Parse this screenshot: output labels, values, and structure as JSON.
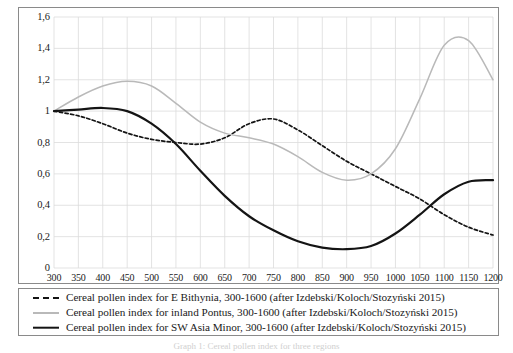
{
  "figure": {
    "caption": "Graph 1: Cereal pollen index for three regions"
  },
  "axes": {
    "y_ticks": [
      "0",
      "0,2",
      "0,4",
      "0,6",
      "0,8",
      "1",
      "1,2",
      "1,4",
      "1,6"
    ],
    "x_ticks": [
      "300",
      "350",
      "400",
      "450",
      "500",
      "550",
      "600",
      "650",
      "700",
      "750",
      "800",
      "850",
      "900",
      "950",
      "1000",
      "1050",
      "1100",
      "1150",
      "1200"
    ],
    "y_label": "",
    "x_label": ""
  },
  "legend": {
    "items": [
      {
        "marker": "dashed-black-line",
        "label": "Cereal pollen index for E Bithynia, 300-1600 (after Izdebski/Koloch/Stozyński 2015)"
      },
      {
        "marker": "solid-gray-line",
        "label": "Cereal pollen index for inland Pontus, 300-1600 (after Izdebski/Koloch/Stozyński 2015)"
      },
      {
        "marker": "solid-black-line",
        "label": "Cereal pollen index for SW Asia Minor, 300-1600 (after Izdebski/Koloch/Stozyński 2015)"
      }
    ]
  },
  "colors": {
    "series_bithynia": "#141414",
    "series_pontus": "#b9b9b9",
    "series_asia_minor": "#141414",
    "grid": "#dcdcdc",
    "frame": "#8a8a8a"
  },
  "chart_data": {
    "type": "line",
    "title": "",
    "xlabel": "",
    "ylabel": "",
    "xlim": [
      300,
      1200
    ],
    "ylim": [
      0,
      1.6
    ],
    "x_tick_step": 50,
    "y_tick_step": 0.2,
    "grid": true,
    "legend_position": "below-plot",
    "decimal_separator": ",",
    "x": [
      300,
      350,
      400,
      450,
      500,
      550,
      600,
      650,
      700,
      750,
      800,
      850,
      900,
      950,
      1000,
      1050,
      1100,
      1150,
      1200
    ],
    "series": [
      {
        "name": "Cereal pollen index for E Bithynia, 300-1600 (after Izdebski/Koloch/Stozyński 2015)",
        "style": "dashed",
        "color": "#141414",
        "values": [
          1.0,
          0.97,
          0.92,
          0.86,
          0.82,
          0.8,
          0.79,
          0.83,
          0.92,
          0.95,
          0.88,
          0.78,
          0.68,
          0.6,
          0.52,
          0.44,
          0.34,
          0.26,
          0.21
        ]
      },
      {
        "name": "Cereal pollen index for inland Pontus, 300-1600 (after Izdebski/Koloch/Stozyński 2015)",
        "style": "solid-thin",
        "color": "#b9b9b9",
        "values": [
          1.0,
          1.09,
          1.16,
          1.19,
          1.16,
          1.05,
          0.93,
          0.86,
          0.83,
          0.79,
          0.71,
          0.61,
          0.56,
          0.6,
          0.76,
          1.08,
          1.42,
          1.45,
          1.2
        ]
      },
      {
        "name": "Cereal pollen index for SW Asia Minor, 300-1600 (after Izdebski/Koloch/Stozyński 2015)",
        "style": "solid-thick",
        "color": "#141414",
        "values": [
          1.0,
          1.01,
          1.02,
          1.0,
          0.92,
          0.79,
          0.62,
          0.46,
          0.33,
          0.24,
          0.17,
          0.13,
          0.12,
          0.14,
          0.22,
          0.34,
          0.47,
          0.55,
          0.56
        ]
      }
    ]
  }
}
